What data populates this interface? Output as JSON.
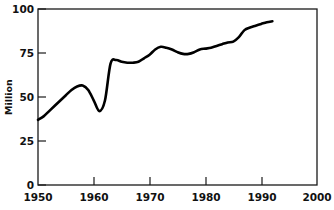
{
  "chart_data": {
    "type": "line",
    "title": "",
    "subtitle": "",
    "xlabel": "",
    "ylabel": "Million",
    "xlim": [
      1950,
      2000
    ],
    "ylim": [
      0,
      100
    ],
    "xticks": [
      1950,
      1960,
      1970,
      1980,
      1990,
      2000
    ],
    "xtick_labels": [
      "1950",
      "1960",
      "1970",
      "1980",
      "1990",
      "2000"
    ],
    "yticks": [
      0,
      25,
      50,
      75,
      100
    ],
    "ytick_labels": [
      "0",
      "25",
      "50",
      "75",
      "100"
    ],
    "grid": false,
    "legend": null,
    "legend_position": "none",
    "line_color": "#000000",
    "frame_color": "#1a1a1a",
    "background_color": "#ffffff",
    "series": [
      {
        "name": "Million",
        "x": [
          1950,
          1951,
          1952,
          1953,
          1954,
          1955,
          1956,
          1957,
          1958,
          1959,
          1960,
          1961,
          1962,
          1963,
          1964,
          1965,
          1966,
          1967,
          1968,
          1969,
          1970,
          1971,
          1972,
          1973,
          1974,
          1975,
          1976,
          1977,
          1978,
          1979,
          1980,
          1981,
          1982,
          1983,
          1984,
          1985,
          1986,
          1987,
          1988,
          1989,
          1990,
          1991,
          1992
        ],
        "values": [
          37,
          39,
          42,
          45,
          48,
          51,
          54,
          56,
          56.5,
          54,
          48,
          42,
          48,
          69,
          71,
          70,
          69.5,
          69.5,
          70,
          72,
          74,
          77,
          78.5,
          78,
          77,
          75.5,
          74.5,
          74.5,
          75.5,
          77,
          77.5,
          78,
          79,
          80,
          81,
          81.5,
          84,
          88,
          89.5,
          90.5,
          91.5,
          92.5,
          93
        ]
      }
    ],
    "annotations": []
  },
  "axis": {
    "y_title": "Million"
  }
}
